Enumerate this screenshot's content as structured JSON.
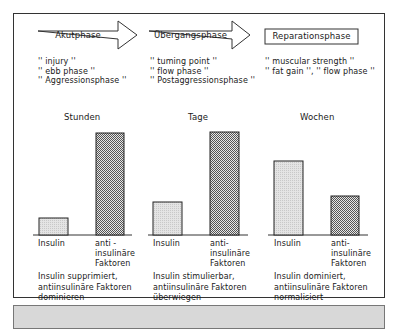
{
  "phases": [
    {
      "name": "Akutphase",
      "quotes": [
        "'' injury ''",
        "'' ebb phase ''",
        "'' Aggressionsphase ''"
      ],
      "time_unit": "Stunden",
      "bars": [
        {
          "label": "Insulin",
          "relative_height": 0.2,
          "fill": "light"
        },
        {
          "label": "anti-\ninsulinäre\nFaktoren",
          "relative_height": 1.0,
          "fill": "dotted"
        }
      ],
      "description": [
        "Insulin supprimiert,",
        "antiinsulinäre Faktoren",
        "dominieren"
      ]
    },
    {
      "name": "Übergangsphase",
      "quotes": [
        "'' tuming point ''",
        "'' flow phase ''",
        "'' Postaggressionsphase ''"
      ],
      "time_unit": "Tage",
      "bars": [
        {
          "label": "Insulin",
          "relative_height": 0.32,
          "fill": "light"
        },
        {
          "label": "anti-\ninsulinäre\nFaktoren",
          "relative_height": 1.0,
          "fill": "dotted"
        }
      ],
      "description": [
        "Insulin stimulierbar,",
        "antiinsulinäre Faktoren",
        "überwiegen"
      ]
    },
    {
      "name": "Reparationsphase",
      "quotes": [
        "'' muscular strength ''",
        "'' fat gain '', '' flow phase ''"
      ],
      "time_unit": "Wochen",
      "bars": [
        {
          "label": "Insulin",
          "relative_height": 0.72,
          "fill": "light"
        },
        {
          "label": "anti-\ninsulinäre\nFaktoren",
          "relative_height": 0.38,
          "fill": "dotted"
        }
      ],
      "description": [
        "Insulin dominiert,",
        "antiinsulinäre Faktoren",
        "normalisiert"
      ]
    }
  ],
  "labels": {
    "p1_name": "Akutphase",
    "p2_name": "Übergangsphase",
    "p3_name": "Reparationsphase",
    "p1_q1": "'' injury ''",
    "p1_q2": "'' ebb phase ''",
    "p1_q3": "'' Aggressionsphase ''",
    "p2_q1": "'' tuming point ''",
    "p2_q2": "'' flow phase ''",
    "p2_q3": "'' Postaggressionsphase ''",
    "p3_q1": "'' muscular strength ''",
    "p3_q2": "'' fat gain '', '' flow phase ''",
    "p1_time": "Stunden",
    "p2_time": "Tage",
    "p3_time": "Wochen",
    "insulin": "Insulin",
    "anti_1": "anti -",
    "anti_1b": "anti-",
    "anti_2": "insulinäre",
    "anti_3": "Faktoren",
    "p1_d1": "Insulin supprimiert,",
    "p1_d2": "antiinsulinäre Faktoren",
    "p1_d3": "dominieren",
    "p2_d1": "Insulin stimulierbar,",
    "p2_d2": "antiinsulinäre Faktoren",
    "p2_d3": "überwiegen",
    "p3_d1": "Insulin dominiert,",
    "p3_d2": "antiinsulinäre Faktoren",
    "p3_d3": "normalisiert"
  },
  "colors": {
    "line": "#333333",
    "insulin_fill": "#dcdcdc",
    "anti_fill": "#bdbdbd",
    "bottom_bar": "#d8d8d8"
  }
}
